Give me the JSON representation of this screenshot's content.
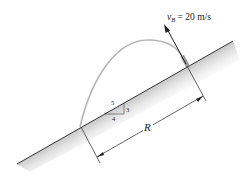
{
  "diagram": {
    "velocity_label": {
      "symbol": "v",
      "subscript": "B",
      "rest": " = 20 m/s"
    },
    "range_label": "R",
    "slope_triangle": {
      "hypotenuse": "5",
      "rise": "3",
      "run": "4"
    },
    "colors": {
      "trajectory": "#b8b8b8",
      "ground_shade": "#d6d6d6",
      "line": "#222222"
    }
  }
}
